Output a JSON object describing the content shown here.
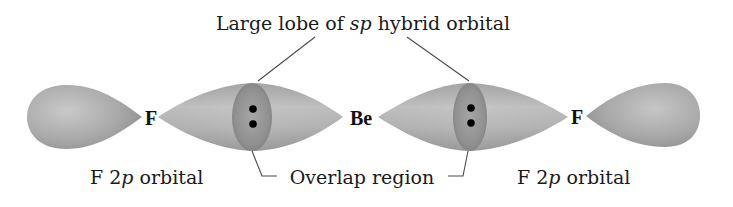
{
  "title": "Large lobe of sp hybrid orbital",
  "title_parts": {
    "pre": "Large lobe of ",
    "italic": "sp",
    "post": " hybrid orbital"
  },
  "atoms": {
    "left_f": "F",
    "center_be": "Be",
    "right_f": "F"
  },
  "labels": {
    "left_orbital": {
      "pre": "F 2",
      "italic": "p",
      "post": " orbital"
    },
    "overlap": "Overlap region",
    "right_orbital": {
      "pre": "F 2",
      "italic": "p",
      "post": " orbital"
    }
  },
  "electron_pairs": [
    {
      "location": "left bond overlap",
      "count": 2
    },
    {
      "location": "right bond overlap",
      "count": 2
    }
  ],
  "colors": {
    "lobe_light": "#c4c4c4",
    "lobe_mid": "#a8a8a8",
    "lobe_dark": "#8a8a8a",
    "overlap": "#8f8f8f",
    "electron": "#000000",
    "text": "#1a1a1a"
  }
}
